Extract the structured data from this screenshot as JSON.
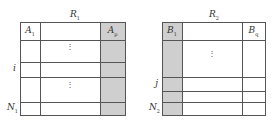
{
  "diagram": {
    "type": "relation-tables",
    "colors": {
      "line": "#555555",
      "shade": "#cfcfcf",
      "background": "#ffffff"
    },
    "left_table": {
      "title": "R",
      "title_sub": "1",
      "first_col_label": "A",
      "first_col_sub": "1",
      "last_col_label": "A",
      "last_col_sub": "p",
      "shaded_column": "last",
      "row_labels": [
        {
          "label": "i",
          "sub": ""
        },
        {
          "label": "N",
          "sub": "1"
        }
      ],
      "ellipsis": "⋮"
    },
    "right_table": {
      "title": "R",
      "title_sub": "2",
      "first_col_label": "B",
      "first_col_sub": "1",
      "last_col_label": "B",
      "last_col_sub": "q",
      "shaded_column": "first",
      "row_labels": [
        {
          "label": "j",
          "sub": ""
        },
        {
          "label": "N",
          "sub": "2"
        }
      ],
      "ellipsis": "⋮"
    }
  }
}
